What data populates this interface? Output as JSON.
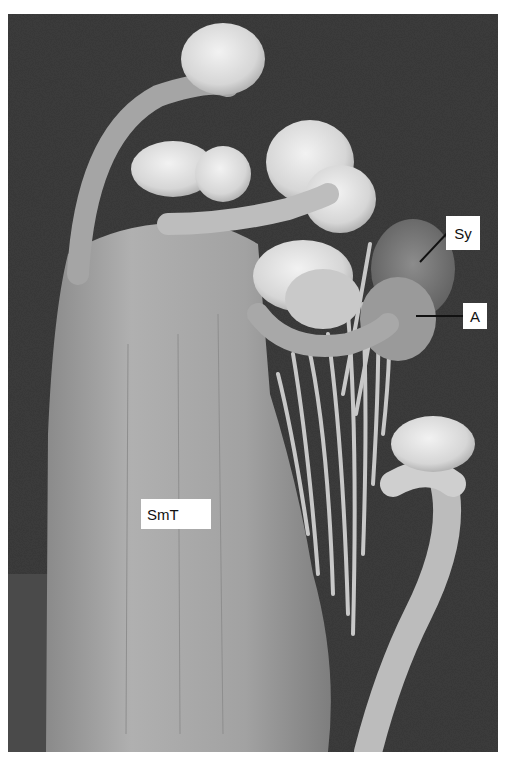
{
  "figure": {
    "type": "scanning electron micrograph",
    "colors": {
      "background_dark": "#3a3a3a",
      "tissue_mid": "#9a9a9a",
      "tissue_light": "#d8d8d8",
      "label_bg": "#ffffff",
      "label_text": "#111111"
    },
    "labels": [
      {
        "id": "sy",
        "text": "Sy"
      },
      {
        "id": "a",
        "text": "A"
      },
      {
        "id": "smt",
        "text": "SmT"
      }
    ]
  }
}
